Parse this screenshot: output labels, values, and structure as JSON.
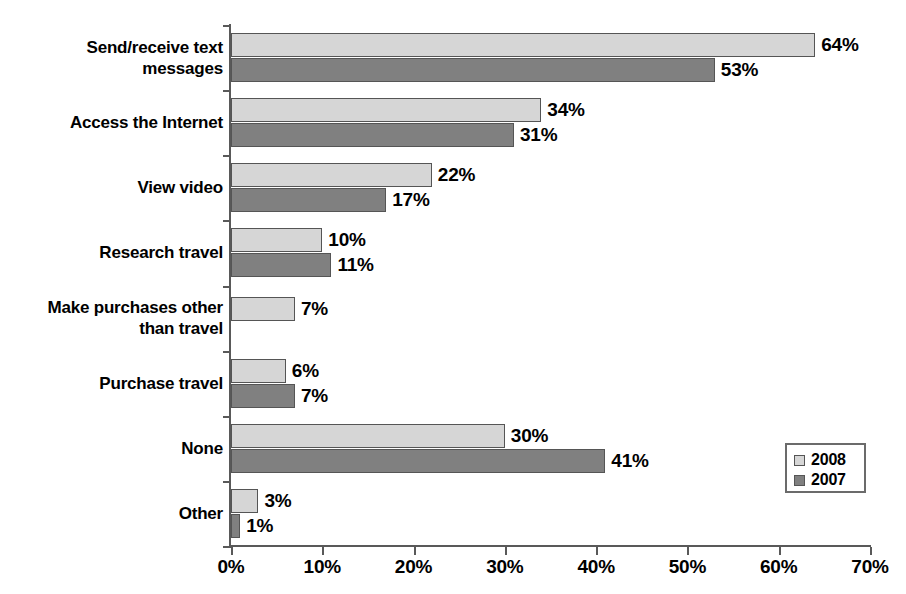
{
  "chart_data": {
    "type": "bar",
    "orientation": "horizontal",
    "title": "",
    "subtitle": "",
    "xlabel": "",
    "ylabel": "",
    "xlim": [
      0,
      70
    ],
    "xticks": [
      "0%",
      "10%",
      "20%",
      "30%",
      "40%",
      "50%",
      "60%",
      "70%"
    ],
    "xtick_values": [
      0,
      10,
      20,
      30,
      40,
      50,
      60,
      70
    ],
    "grid": false,
    "legend_position": "bottom-right",
    "categories": [
      "Send/receive text messages",
      "Access the Internet",
      "View video",
      "Research travel",
      "Make purchases other than travel",
      "Purchase travel",
      "None",
      "Other"
    ],
    "series": [
      {
        "name": "2008",
        "color": "#d6d6d6",
        "values": [
          64,
          34,
          22,
          10,
          7,
          6,
          30,
          3
        ],
        "labels": [
          "64%",
          "34%",
          "22%",
          "10%",
          "7%",
          "6%",
          "30%",
          "3%"
        ]
      },
      {
        "name": "2007",
        "color": "#808080",
        "values": [
          53,
          31,
          17,
          11,
          null,
          7,
          41,
          1
        ],
        "labels": [
          "53%",
          "31%",
          "17%",
          "11%",
          "",
          "7%",
          "41%",
          "1%"
        ]
      }
    ]
  },
  "category_labels": [
    {
      "line1": "Send/receive text",
      "line2": "messages"
    },
    {
      "line1": "Access the Internet",
      "line2": ""
    },
    {
      "line1": "View video",
      "line2": ""
    },
    {
      "line1": "Research travel",
      "line2": ""
    },
    {
      "line1": "Make purchases other",
      "line2": "than travel"
    },
    {
      "line1": "Purchase travel",
      "line2": ""
    },
    {
      "line1": "None",
      "line2": ""
    },
    {
      "line1": "Other",
      "line2": ""
    }
  ],
  "legend": {
    "items": [
      {
        "label": "2008",
        "color": "#d6d6d6"
      },
      {
        "label": "2007",
        "color": "#808080"
      }
    ]
  },
  "axis": {
    "x_ticks": [
      {
        "label": "0%",
        "value": 0
      },
      {
        "label": "10%",
        "value": 10
      },
      {
        "label": "20%",
        "value": 20
      },
      {
        "label": "30%",
        "value": 30
      },
      {
        "label": "40%",
        "value": 40
      },
      {
        "label": "50%",
        "value": 50
      },
      {
        "label": "60%",
        "value": 60
      },
      {
        "label": "70%",
        "value": 70
      }
    ]
  },
  "colors": {
    "series_2008": "#d6d6d6",
    "series_2007": "#808080",
    "axis": "#595959",
    "text": "#000000",
    "background": "#ffffff"
  }
}
